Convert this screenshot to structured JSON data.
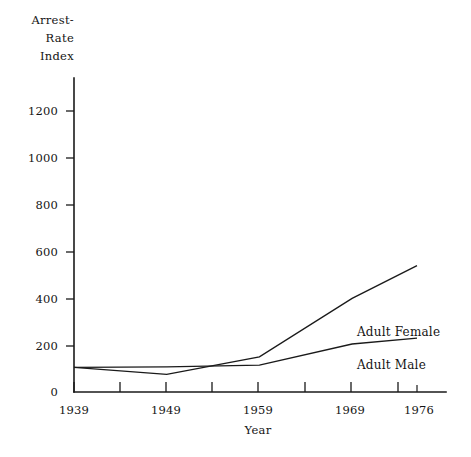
{
  "chart_data": {
    "type": "line",
    "title": "",
    "ylabel": "Arrest-\nRate\nIndex",
    "ylabel_lines": [
      "Arrest-",
      "Rate",
      "Index"
    ],
    "xlabel": "Year",
    "x": [
      1939,
      1949,
      1959,
      1969,
      1976
    ],
    "categories": [
      "1939",
      "1949",
      "1959",
      "1969",
      "1976"
    ],
    "xtick_labels": [
      "1939",
      "1949",
      "1959",
      "1969",
      "1976"
    ],
    "ytick_labels": [
      "0",
      "200",
      "400",
      "600",
      "800",
      "1000",
      "1200"
    ],
    "ytick_values": [
      0,
      200,
      400,
      600,
      800,
      1000,
      1200
    ],
    "xlim": [
      1939,
      1979
    ],
    "ylim": [
      0,
      1280
    ],
    "grid": false,
    "legend_position": "inline-right",
    "series": [
      {
        "name": "Adult Female",
        "label": "Adult Female",
        "values": [
          105,
          75,
          150,
          400,
          540
        ],
        "color": "#1a1a1a"
      },
      {
        "name": "Adult Male",
        "label": "Adult Male",
        "values": [
          105,
          107,
          115,
          205,
          230
        ],
        "color": "#1a1a1a"
      }
    ],
    "annotations": [
      {
        "text": "Adult Female",
        "x": 1969,
        "y": 330
      },
      {
        "text": "Adult Male",
        "x": 1969,
        "y": 175
      }
    ]
  },
  "labels": {
    "y_axis_line1": "Arrest-",
    "y_axis_line2": "Rate",
    "y_axis_line3": "Index",
    "x_axis": "Year",
    "series_female": "Adult Female",
    "series_male": "Adult Male",
    "ytick_1200": "1200",
    "ytick_1000": "1000",
    "ytick_800": "800",
    "ytick_600": "600",
    "ytick_400": "400",
    "ytick_200": "200",
    "ytick_0": "0",
    "xtick_1939": "1939",
    "xtick_1949": "1949",
    "xtick_1959": "1959",
    "xtick_1969": "1969",
    "xtick_1976": "1976"
  },
  "colors": {
    "ink": "#1a1a1a",
    "background": "#ffffff"
  }
}
